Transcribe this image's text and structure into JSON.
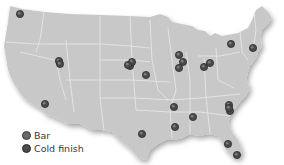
{
  "colors": {
    "land": "#c8c8c8",
    "border": "#eeeeee",
    "background": "#ffffff",
    "bar": "#6a6a6a",
    "cold_finish": "#4a4a4a",
    "marker_outline": "#2e2e2e"
  },
  "legend": {
    "items": [
      {
        "label": "Bar",
        "color": "#6a6a6a"
      },
      {
        "label": "Cold finish",
        "color": "#4a4a4a"
      }
    ]
  },
  "markers": [
    {
      "x": 20,
      "y": 14
    },
    {
      "x": 59,
      "y": 61
    },
    {
      "x": 60,
      "y": 64
    },
    {
      "x": 130,
      "y": 66
    },
    {
      "x": 132,
      "y": 62
    },
    {
      "x": 128,
      "y": 65
    },
    {
      "x": 146,
      "y": 75
    },
    {
      "x": 179,
      "y": 55
    },
    {
      "x": 183,
      "y": 62
    },
    {
      "x": 179,
      "y": 68
    },
    {
      "x": 204,
      "y": 67
    },
    {
      "x": 210,
      "y": 63
    },
    {
      "x": 231,
      "y": 44
    },
    {
      "x": 253,
      "y": 48
    },
    {
      "x": 45,
      "y": 104
    },
    {
      "x": 174,
      "y": 107
    },
    {
      "x": 193,
      "y": 117
    },
    {
      "x": 175,
      "y": 127
    },
    {
      "x": 142,
      "y": 134
    },
    {
      "x": 229,
      "y": 105
    },
    {
      "x": 230,
      "y": 111
    },
    {
      "x": 229,
      "y": 108
    },
    {
      "x": 228,
      "y": 144
    },
    {
      "x": 237,
      "y": 155
    }
  ]
}
